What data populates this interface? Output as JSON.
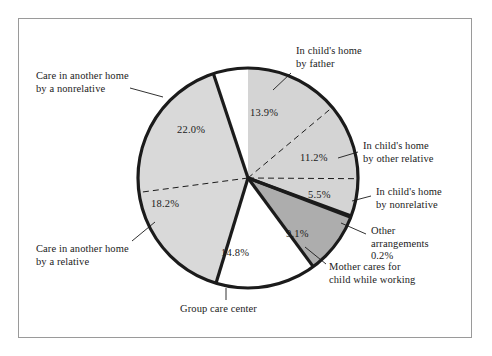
{
  "figure": {
    "background_color": "#ffffff",
    "frame_color": "#9a9a9a"
  },
  "chart_data": {
    "type": "pie",
    "title": "",
    "subtitle": "",
    "xlabel": "",
    "ylabel": "",
    "legend_position": "none",
    "grid": false,
    "start_angle_deg": 90,
    "direction": "clockwise",
    "center_px": [
      248,
      178
    ],
    "radius_px": 110,
    "units": "percent",
    "total": 100.0,
    "categories": [
      "In child's home by father",
      "In child's home by other relative",
      "In child's home by nonrelative",
      "Other arrangements",
      "Mother cares for child while working",
      "Group care center",
      "Care in another home by a relative",
      "Care in another home by a nonrelative"
    ],
    "values": [
      13.9,
      11.2,
      5.5,
      0.2,
      9.1,
      14.8,
      18.2,
      22.0
    ],
    "value_labels": [
      "13.9%",
      "11.2%",
      "5.5%",
      "0.2%",
      "9.1%",
      "14.8%",
      "18.2%",
      "22.0%"
    ],
    "slice_colors": [
      "#d4d4d4",
      "#d4d4d4",
      "#d4d4d4",
      "#1b1b1b",
      "#adadad",
      "#ffffff",
      "#d9d9d9",
      "#d9d9d9"
    ],
    "slices": [
      {
        "name": "In child's home by father",
        "value": 13.9,
        "value_label": "13.9%",
        "fill": "#d4d4d4",
        "divider_after": "dashed",
        "label_x": 250,
        "label_y": 107,
        "callout_lines": [
          "In child's home",
          "by father"
        ],
        "callout_x": 296,
        "callout_y": 45,
        "callout_align": "right",
        "leader": [
          [
            291,
            73
          ],
          [
            273,
            90
          ]
        ]
      },
      {
        "name": "In child's home by other relative",
        "value": 11.2,
        "value_label": "11.2%",
        "fill": "#d4d4d4",
        "divider_after": "dashed",
        "label_x": 300,
        "label_y": 152,
        "callout_lines": [
          "In child's home",
          "by other relative"
        ],
        "callout_x": 363,
        "callout_y": 140,
        "callout_align": "right",
        "leader": [
          [
            358,
            152
          ],
          [
            338,
            158
          ]
        ]
      },
      {
        "name": "In child's home by nonrelative",
        "value": 5.5,
        "value_label": "5.5%",
        "fill": "#d4d4d4",
        "divider_after": "solid",
        "label_x": 308,
        "label_y": 189,
        "callout_lines": [
          "In child's home",
          "by nonrelative"
        ],
        "callout_x": 376,
        "callout_y": 186,
        "callout_align": "right",
        "leader": [
          [
            371,
            196
          ],
          [
            352,
            201
          ]
        ]
      },
      {
        "name": "Other arrangements",
        "value": 0.2,
        "value_label": "0.2%",
        "fill": "#1b1b1b",
        "divider_after": "solid",
        "label_x": 0,
        "label_y": 0,
        "callout_lines": [
          "Other",
          "arrangements",
          "0.2%"
        ],
        "callout_x": 371,
        "callout_y": 225,
        "callout_align": "right",
        "leader": [
          [
            366,
            234
          ],
          [
            341,
            223
          ]
        ]
      },
      {
        "name": "Mother cares for child while working",
        "value": 9.1,
        "value_label": "9.1%",
        "fill": "#adadad",
        "divider_after": "solid",
        "label_x": 286,
        "label_y": 228,
        "callout_lines": [
          "Mother cares for",
          "child while working"
        ],
        "callout_x": 329,
        "callout_y": 261,
        "callout_align": "right",
        "leader": [
          [
            326,
            264
          ],
          [
            305,
            247
          ]
        ]
      },
      {
        "name": "Group care center",
        "value": 14.8,
        "value_label": "14.8%",
        "fill": "#ffffff",
        "divider_after": "solid",
        "label_x": 221,
        "label_y": 247,
        "callout_lines": [
          "Group care center"
        ],
        "callout_x": 180,
        "callout_y": 303,
        "callout_align": "center",
        "leader": [
          [
            226,
            288
          ],
          [
            226,
            300
          ]
        ]
      },
      {
        "name": "Care in another home by a relative",
        "value": 18.2,
        "value_label": "18.2%",
        "fill": "#d9d9d9",
        "divider_after": "dashed",
        "label_x": 151,
        "label_y": 198,
        "callout_lines": [
          "Care in another home",
          "by a relative"
        ],
        "callout_x": 36,
        "callout_y": 243,
        "callout_align": "left",
        "leader": [
          [
            132,
            241
          ],
          [
            155,
            222
          ]
        ]
      },
      {
        "name": "Care in another home by a nonrelative",
        "value": 22.0,
        "value_label": "22.0%",
        "fill": "#d9d9d9",
        "divider_after": "solid",
        "label_x": 177,
        "label_y": 124,
        "callout_lines": [
          "Care in another home",
          "by a nonrelative"
        ],
        "callout_x": 36,
        "callout_y": 70,
        "callout_align": "left",
        "leader": [
          [
            130,
            88
          ],
          [
            163,
            97
          ]
        ]
      }
    ],
    "annotations": {
      "solid_dividers": "thick black boundaries between major care groups",
      "dashed_dividers": "thin dashed boundaries subdividing within a group",
      "outline": "thick black pie outline"
    }
  }
}
